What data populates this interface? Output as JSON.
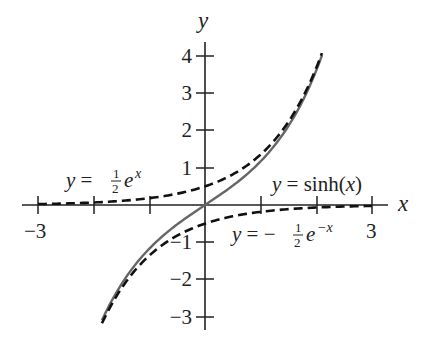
{
  "chart_data": {
    "type": "line",
    "title": "",
    "xlabel": "x",
    "ylabel": "y",
    "xlim": [
      -3.3,
      3.5
    ],
    "ylim": [
      -3.3,
      4.3
    ],
    "grid": false,
    "x_ticks": [
      -3,
      -2,
      -1,
      1,
      2,
      3
    ],
    "x_tick_labels": [
      {
        "value": -3,
        "label": "−3"
      },
      {
        "value": 3,
        "label": "3"
      }
    ],
    "y_ticks": [
      -3,
      -2,
      -1,
      1,
      2,
      3,
      4
    ],
    "y_tick_labels": [
      {
        "value": 4,
        "label": "4"
      },
      {
        "value": 3,
        "label": "3"
      },
      {
        "value": 2,
        "label": "2"
      },
      {
        "value": 1,
        "label": "1"
      },
      {
        "value": -1,
        "label": "−1"
      },
      {
        "value": -2,
        "label": "−2"
      },
      {
        "value": -3,
        "label": "−3"
      }
    ],
    "series": [
      {
        "name": "y = sinh(x)",
        "style": "solid",
        "color": "#666666",
        "x": [
          -1.85,
          -1.5,
          -1.0,
          -0.5,
          0,
          0.5,
          1.0,
          1.5,
          2.0,
          2.1
        ],
        "values": [
          -3.1,
          -2.13,
          -1.18,
          -0.52,
          0,
          0.52,
          1.18,
          2.13,
          3.63,
          4.02
        ]
      },
      {
        "name": "y = ½ e^x",
        "style": "dashed",
        "color": "#111111",
        "x": [
          -3.0,
          -2.0,
          -1.0,
          0,
          1.0,
          1.5,
          2.0,
          2.1
        ],
        "values": [
          0.02,
          0.07,
          0.18,
          0.5,
          1.36,
          2.24,
          3.69,
          4.08
        ]
      },
      {
        "name": "y = −½ e^{−x}",
        "style": "dashed",
        "color": "#111111",
        "x": [
          -1.85,
          -1.5,
          -1.0,
          0,
          1.0,
          2.0,
          3.0
        ],
        "values": [
          -3.18,
          -2.24,
          -1.36,
          -0.5,
          -0.18,
          -0.07,
          -0.02
        ]
      }
    ],
    "annotations": [
      {
        "text": "y = ½ e^x",
        "near": [
          -2.6,
          0.5
        ]
      },
      {
        "text": "y = sinh(x)",
        "near": [
          1.9,
          0.9
        ]
      },
      {
        "text": "y = −½ e^−x",
        "near": [
          1.4,
          -0.8
        ]
      }
    ]
  },
  "labels": {
    "x_axis": "x",
    "y_axis": "y",
    "eq_exp": {
      "y": "y",
      "eq": " = ",
      "num": "1",
      "den": "2",
      "e": "e",
      "exp": "x"
    },
    "eq_sinh": {
      "y": "y",
      "eq": " = sinh(",
      "x": "x",
      "close": ")"
    },
    "eq_negexp": {
      "y": "y",
      "eq": " = −",
      "num": "1",
      "den": "2",
      "e": "e",
      "exp": "−x"
    },
    "x_tick_left": "−3",
    "x_tick_right": "3",
    "y_ticks": [
      "4",
      "3",
      "2",
      "1",
      "−1",
      "−2",
      "−3"
    ]
  }
}
